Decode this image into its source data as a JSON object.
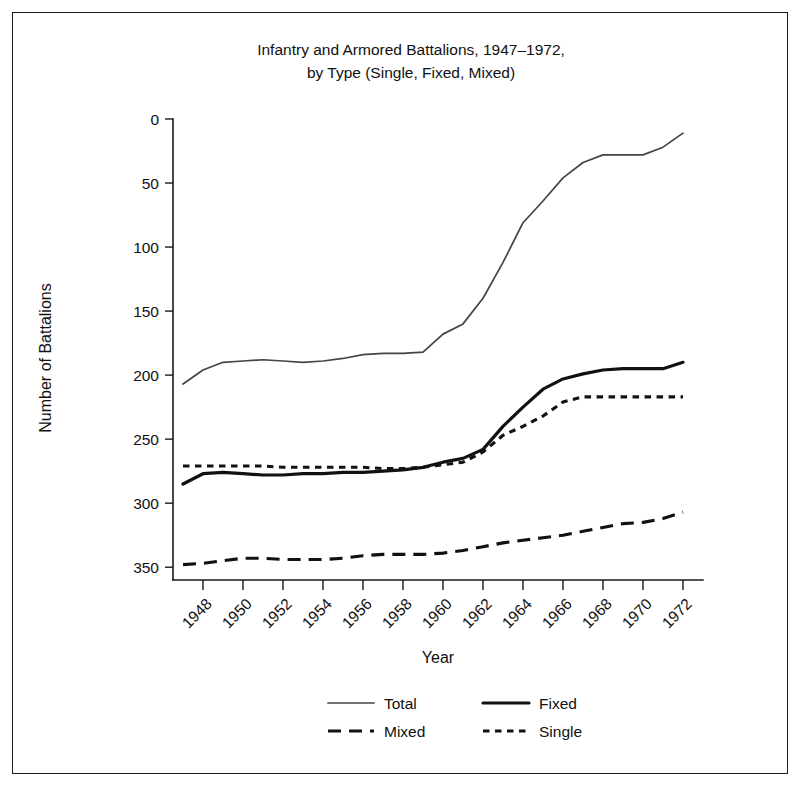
{
  "figure": {
    "title_line1": "Infantry and Armored Battalions, 1947–1972,",
    "title_line2": "by Type (Single, Fixed, Mixed)",
    "border_color": "#1a1a1a",
    "background": "#ffffff"
  },
  "chart_data": {
    "type": "line",
    "title": "Infantry and Armored Battalions, 1947–1972, by Type (Single, Fixed, Mixed)",
    "xlabel": "Year",
    "ylabel": "Number of Battalions",
    "grid": false,
    "y_inverted": true,
    "xlim": [
      1947,
      1972
    ],
    "ylim": [
      0,
      360
    ],
    "x_ticks": [
      1948,
      1950,
      1952,
      1954,
      1956,
      1958,
      1960,
      1962,
      1964,
      1966,
      1968,
      1970,
      1972
    ],
    "x_tick_labels": [
      "1948",
      "1950",
      "1952",
      "1954",
      "1956",
      "1958",
      "1960",
      "1962",
      "1964",
      "1966",
      "1968",
      "1970",
      "1972"
    ],
    "x_tick_rotation": 45,
    "y_ticks": [
      0,
      50,
      100,
      150,
      200,
      250,
      300,
      350
    ],
    "y_tick_labels": [
      "0",
      "50",
      "100",
      "150",
      "200",
      "250",
      "300",
      "350"
    ],
    "x": [
      1947,
      1948,
      1949,
      1950,
      1951,
      1952,
      1953,
      1954,
      1955,
      1956,
      1957,
      1958,
      1959,
      1960,
      1961,
      1962,
      1963,
      1964,
      1965,
      1966,
      1967,
      1968,
      1969,
      1970,
      1971,
      1972
    ],
    "legend_position": "bottom-center",
    "series": [
      {
        "name": "Total",
        "style": "solid-thin",
        "color": "#444444",
        "values": [
          207,
          196,
          190,
          189,
          188,
          189,
          190,
          189,
          187,
          184,
          183,
          183,
          182,
          168,
          160,
          140,
          112,
          81,
          64,
          46,
          34,
          28,
          28,
          28,
          22,
          11
        ]
      },
      {
        "name": "Fixed",
        "style": "solid-thick",
        "color": "#111111",
        "values": [
          285,
          277,
          276,
          277,
          278,
          278,
          277,
          277,
          276,
          276,
          275,
          274,
          272,
          268,
          265,
          258,
          240,
          225,
          211,
          203,
          199,
          196,
          195,
          195,
          195,
          190
        ]
      },
      {
        "name": "Mixed",
        "style": "dashed",
        "color": "#111111",
        "values": [
          348,
          347,
          345,
          343,
          343,
          344,
          344,
          344,
          343,
          341,
          340,
          340,
          340,
          339,
          337,
          334,
          331,
          329,
          327,
          325,
          322,
          319,
          316,
          315,
          312,
          307
        ]
      },
      {
        "name": "Single",
        "style": "dotted",
        "color": "#111111",
        "values": [
          271,
          271,
          271,
          271,
          271,
          272,
          272,
          272,
          272,
          272,
          273,
          273,
          272,
          270,
          268,
          260,
          247,
          240,
          232,
          221,
          217,
          217,
          217,
          217,
          217,
          217
        ]
      }
    ]
  },
  "legend": {
    "entries": [
      {
        "label": "Total",
        "style": "solid-thin"
      },
      {
        "label": "Fixed",
        "style": "solid-thick"
      },
      {
        "label": "Mixed",
        "style": "dashed"
      },
      {
        "label": "Single",
        "style": "dotted"
      }
    ]
  }
}
